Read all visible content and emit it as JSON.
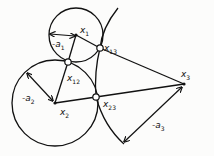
{
  "diagram": {
    "stroke_color": "#111111",
    "background": "#fcfcfb",
    "circles": [
      {
        "id": "c1",
        "cx": 76,
        "cy": 35,
        "r": 27
      },
      {
        "id": "c2",
        "cx": 55,
        "cy": 103,
        "r": 43
      }
    ],
    "arcs": [
      {
        "id": "c3-arc",
        "path": "M118,8 Q102,28 100,48 Q94,72 96,97 Q104,126 124,144"
      }
    ],
    "points": [
      {
        "id": "x1",
        "label": "x",
        "sub": "1",
        "x": 76,
        "y": 35,
        "lx": 80,
        "ly": 26
      },
      {
        "id": "x2",
        "label": "x",
        "sub": "2",
        "x": 55,
        "y": 103,
        "lx": 60,
        "ly": 108
      },
      {
        "id": "x3",
        "label": "x",
        "sub": "3",
        "x": 184,
        "y": 84,
        "lx": 181,
        "ly": 70
      },
      {
        "id": "x12",
        "label": "x",
        "sub": "12",
        "x": 68,
        "y": 62,
        "lx": 67,
        "ly": 74
      },
      {
        "id": "x13",
        "label": "x",
        "sub": "13",
        "x": 100,
        "y": 48,
        "lx": 104,
        "ly": 44
      },
      {
        "id": "x23",
        "label": "x",
        "sub": "23",
        "x": 96,
        "y": 97,
        "lx": 103,
        "ly": 100
      }
    ],
    "radius_labels": [
      {
        "id": "a1",
        "text": "-a",
        "sub": "1",
        "x": 52,
        "y": 40
      },
      {
        "id": "a2",
        "text": "-a",
        "sub": "2",
        "x": 22,
        "y": 94
      },
      {
        "id": "a3",
        "text": "-a",
        "sub": "3",
        "x": 152,
        "y": 121
      }
    ],
    "segments": [
      {
        "id": "x1-x13",
        "x1": 76,
        "y1": 35,
        "x2": 100,
        "y2": 48
      },
      {
        "id": "x13-x3",
        "x1": 100,
        "y1": 48,
        "x2": 184,
        "y2": 84
      },
      {
        "id": "x2-x23",
        "x1": 55,
        "y1": 103,
        "x2": 96,
        "y2": 97
      },
      {
        "id": "x23-x3",
        "x1": 96,
        "y1": 97,
        "x2": 184,
        "y2": 84
      },
      {
        "id": "x2-x12",
        "x1": 55,
        "y1": 103,
        "x2": 68,
        "y2": 62
      },
      {
        "id": "x12-x1",
        "x1": 68,
        "y1": 62,
        "x2": 76,
        "y2": 35
      }
    ],
    "radius_arrows": [
      {
        "id": "arrow-a1",
        "x1": 50,
        "y1": 34,
        "x2": 75,
        "y2": 36
      },
      {
        "id": "arrow-a2",
        "x1": 27,
        "y1": 73,
        "x2": 53,
        "y2": 101
      },
      {
        "id": "arrow-a3",
        "x1": 124,
        "y1": 142,
        "x2": 182,
        "y2": 87
      }
    ]
  }
}
